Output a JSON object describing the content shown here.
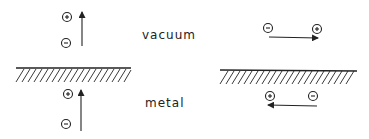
{
  "labels": {
    "vacuum": "vacuum",
    "metal": "metal"
  },
  "symbols": {
    "positive": "+",
    "negative": "−"
  },
  "colors": {
    "ink": "#222222",
    "background": "#ffffff"
  },
  "panels": [
    {
      "name": "perpendicular-dipoles",
      "vacuum_dipole": {
        "orientation": "vertical",
        "arrow": "up",
        "top_charge": "+",
        "bottom_charge": "−"
      },
      "image_dipole": {
        "orientation": "vertical",
        "arrow": "up",
        "top_charge": "+",
        "bottom_charge": "−"
      }
    },
    {
      "name": "parallel-dipoles",
      "vacuum_dipole": {
        "orientation": "horizontal",
        "arrow": "right",
        "left_charge": "−",
        "right_charge": "+"
      },
      "image_dipole": {
        "orientation": "horizontal",
        "arrow": "left",
        "left_charge": "+",
        "right_charge": "−"
      }
    }
  ]
}
